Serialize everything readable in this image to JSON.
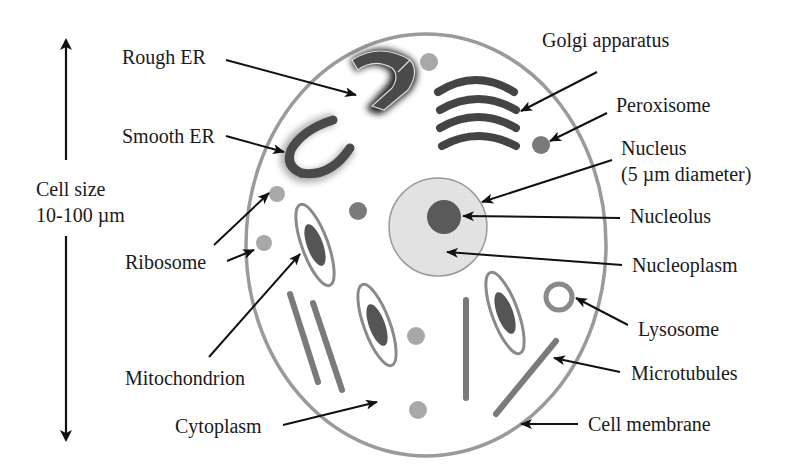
{
  "diagram": {
    "type": "labeled-illustration",
    "scale": {
      "label_line1": "Cell size",
      "label_line2": "10-100 µm"
    },
    "labels": {
      "rough_er": "Rough ER",
      "smooth_er": "Smooth ER",
      "ribosome": "Ribosome",
      "mitochondrion": "Mitochondrion",
      "cytoplasm": "Cytoplasm",
      "golgi": "Golgi apparatus",
      "peroxisome": "Peroxisome",
      "nucleus_line1": "Nucleus",
      "nucleus_line2": "(5 µm diameter)",
      "nucleolus": "Nucleolus",
      "nucleoplasm": "Nucleoplasm",
      "lysosome": "Lysosome",
      "microtubules": "Microtubules",
      "cell_membrane": "Cell membrane"
    },
    "colors": {
      "membrane": "#9a9a9a",
      "organelle_dark": "#4a4a4a",
      "organelle_mid": "#7a7a7a",
      "granule": "#a8a8a8",
      "nucleus_fill": "#e2e2e2",
      "nucleolus": "#5a5a5a",
      "arrow": "#111111",
      "text": "#1a1a1a"
    }
  }
}
